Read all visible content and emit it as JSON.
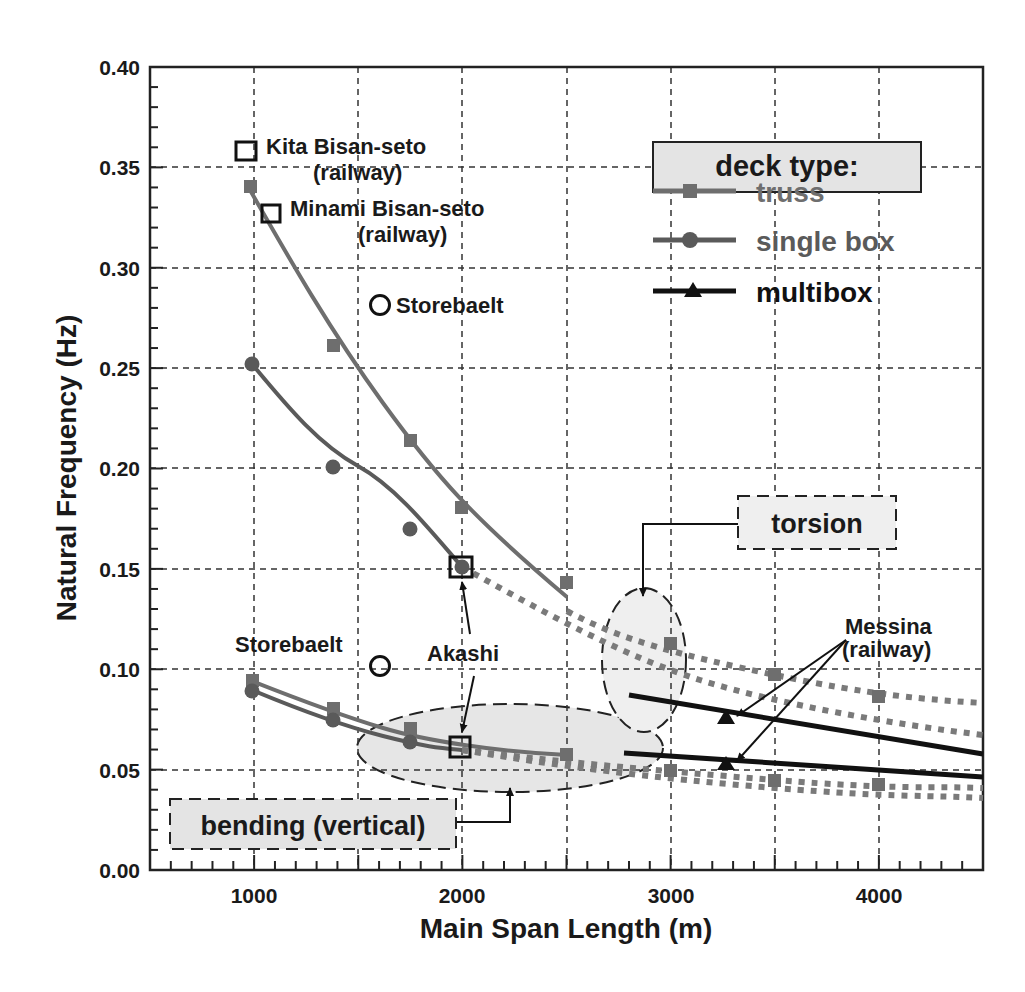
{
  "chart_data": {
    "type": "line",
    "title": "",
    "xlabel": "Main Span Length (m)",
    "ylabel": "Natural Frequency (Hz)",
    "xlim": [
      500,
      4500
    ],
    "ylim": [
      0.0,
      0.4
    ],
    "grid": true,
    "x_ticks": [
      1000,
      2000,
      3000,
      4000
    ],
    "x_tick_labels": [
      "1000",
      "2000",
      "3000",
      "4000"
    ],
    "y_ticks": [
      0.0,
      0.05,
      0.1,
      0.15,
      0.2,
      0.25,
      0.3,
      0.35,
      0.4
    ],
    "y_tick_labels": [
      "0.00",
      "0.05",
      "0.10",
      "0.15",
      "0.20",
      "0.25",
      "0.30",
      "0.35",
      "0.40"
    ],
    "legend": {
      "title": "deck type:",
      "position": "upper right",
      "entries": [
        {
          "label": "truss",
          "marker": "square",
          "color": "#6e6e6e"
        },
        {
          "label": "single box",
          "marker": "circle",
          "color": "#5a5a5a"
        },
        {
          "label": "multibox",
          "marker": "triangle",
          "color": "#111111"
        }
      ]
    },
    "series": [
      {
        "name": "truss (torsion)",
        "marker": "square",
        "color": "#6e6e6e",
        "x": [
          1000,
          1400,
          1750,
          2000,
          2500,
          3000,
          3500,
          4000
        ],
        "y": [
          0.339,
          0.26,
          0.213,
          0.18,
          0.129,
          0.112,
          0.097,
          0.086
        ]
      },
      {
        "name": "single box (torsion)",
        "marker": "circle",
        "color": "#5a5a5a",
        "x": [
          1000,
          1400,
          1750,
          2000
        ],
        "y": [
          0.252,
          0.201,
          0.169,
          0.151
        ]
      },
      {
        "name": "truss (bending)",
        "marker": "square",
        "color": "#6e6e6e",
        "x": [
          1000,
          1400,
          1750,
          2000,
          2500,
          3000,
          3500,
          4000
        ],
        "y": [
          0.094,
          0.08,
          0.07,
          0.06,
          0.057,
          0.049,
          0.044,
          0.042
        ]
      },
      {
        "name": "single box (bending)",
        "marker": "circle",
        "color": "#5a5a5a",
        "x": [
          1000,
          1400,
          1750,
          2000
        ],
        "y": [
          0.089,
          0.075,
          0.064,
          0.06
        ]
      },
      {
        "name": "multibox (torsion)",
        "marker": "triangle",
        "color": "#111111",
        "x": [
          2800,
          3300,
          4500
        ],
        "y": [
          0.087,
          0.076,
          0.058
        ]
      },
      {
        "name": "multibox (bending)",
        "marker": "triangle",
        "color": "#111111",
        "x": [
          2800,
          3300,
          4500
        ],
        "y": [
          0.058,
          0.054,
          0.046
        ]
      }
    ],
    "extrapolations": [
      {
        "name": "truss torsion extrapolation (dotted)",
        "x": [
          2500,
          3000,
          3500,
          4000,
          4500
        ],
        "y": [
          0.129,
          0.11,
          0.097,
          0.089,
          0.083
        ]
      },
      {
        "name": "single box torsion extrapolation (dotted)",
        "x": [
          2000,
          2500,
          3000,
          3500,
          4000,
          4500
        ],
        "y": [
          0.151,
          0.121,
          0.101,
          0.087,
          0.075,
          0.067
        ]
      },
      {
        "name": "truss bending extrapolation (dotted)",
        "x": [
          2000,
          2500,
          3000,
          3500,
          4000,
          4500
        ],
        "y": [
          0.06,
          0.054,
          0.049,
          0.045,
          0.043,
          0.041
        ]
      },
      {
        "name": "single box bending extrapolation (dotted)",
        "x": [
          2000,
          2500,
          3000,
          3500,
          4000,
          4500
        ],
        "y": [
          0.06,
          0.053,
          0.046,
          0.041,
          0.038,
          0.036
        ]
      }
    ],
    "annotations": [
      {
        "text": "Kita Bisan-seto\n(railway)",
        "marker": "open-square",
        "x": 960,
        "y": 0.356
      },
      {
        "text": "Minami Bisan-seto\n(railway)",
        "marker": "open-square",
        "x": 1080,
        "y": 0.326
      },
      {
        "text": "Storebaelt",
        "marker": "open-circle",
        "x": 1620,
        "y": 0.28
      },
      {
        "text": "Storebaelt",
        "marker": "open-circle",
        "x": 1620,
        "y": 0.101
      },
      {
        "text": "Akashi",
        "marker": "open-square",
        "points": [
          [
            2000,
            0.151
          ],
          [
            2000,
            0.06
          ]
        ]
      },
      {
        "text": "Messina\n(railway)",
        "arrows_to": [
          [
            3300,
            0.076
          ],
          [
            3300,
            0.054
          ]
        ]
      },
      {
        "text": "torsion",
        "region": "dashed ellipse around x=3000, y≈0.065–0.135"
      },
      {
        "text": "bending (vertical)",
        "region": "dashed ellipse around x=1500–3000, y≈0.04–0.08"
      }
    ]
  },
  "labels": {
    "xlabel": "Main Span Length (m)",
    "ylabel": "Natural Frequency (Hz)",
    "legend_title": "deck type:",
    "legend_truss": "truss",
    "legend_single": "single box",
    "legend_multi": "multibox",
    "kita_1": "Kita Bisan-seto",
    "kita_2": "(railway)",
    "minami_1": "Minami Bisan-seto",
    "minami_2": "(railway)",
    "storebaelt_top": "Storebaelt",
    "storebaelt_bottom": "Storebaelt",
    "akashi": "Akashi",
    "messina_1": "Messina",
    "messina_2": "(railway)",
    "torsion": "torsion",
    "bending": "bending (vertical)",
    "x0": "1000",
    "x1": "2000",
    "x2": "3000",
    "x3": "4000",
    "y0": "0.00",
    "y1": "0.05",
    "y2": "0.10",
    "y3": "0.15",
    "y4": "0.20",
    "y5": "0.25",
    "y6": "0.30",
    "y7": "0.35",
    "y8": "0.40"
  },
  "colors": {
    "truss": "#6e6e6e",
    "single_box": "#5a5a5a",
    "multibox": "#111111",
    "region_fill": "#e6e6e6",
    "label_box_fill": "#e4e4e4"
  }
}
